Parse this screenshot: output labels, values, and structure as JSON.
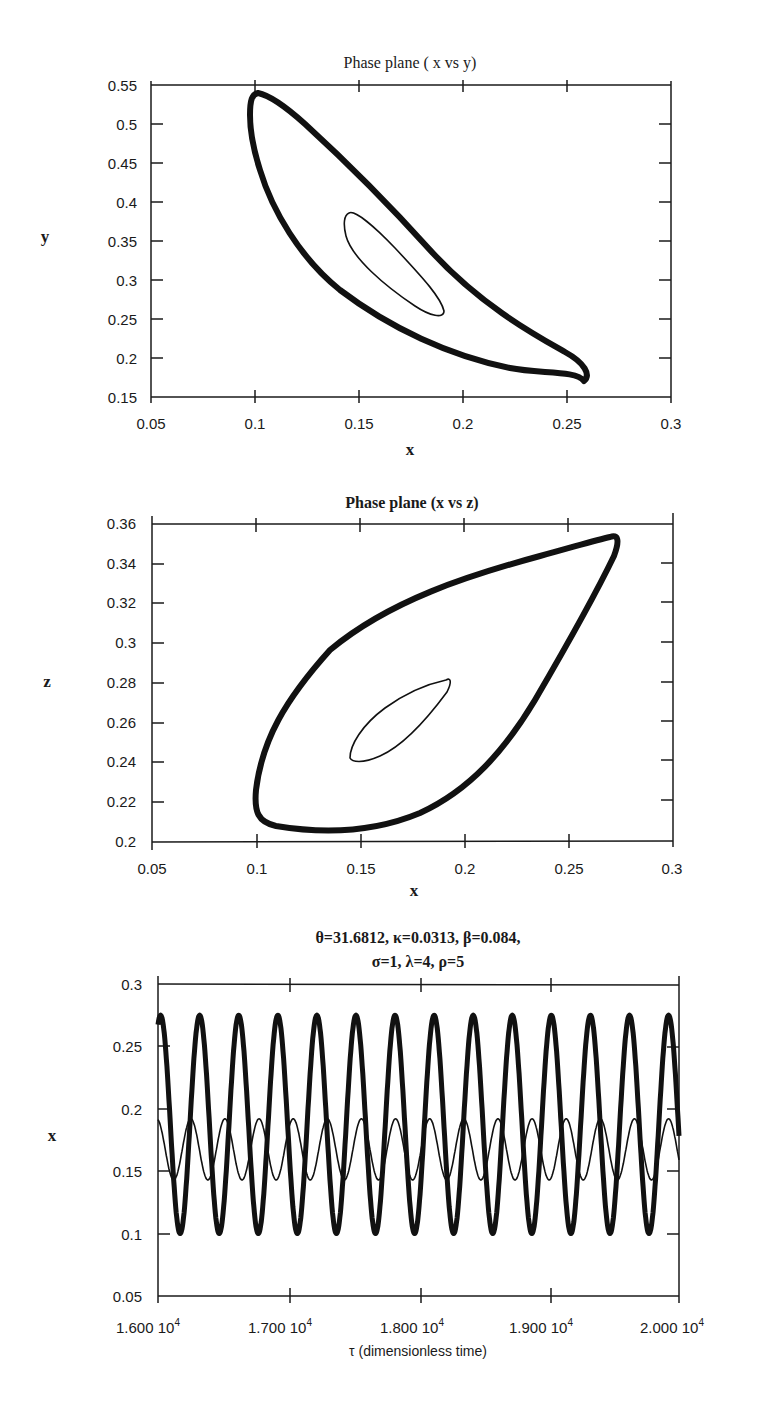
{
  "chart_data": [
    {
      "type": "line",
      "title": "Phase plane ( x vs y)",
      "xlabel": "x",
      "ylabel": "y",
      "xlim": [
        0.05,
        0.3
      ],
      "ylim": [
        0.15,
        0.55
      ],
      "xticks": [
        "0.05",
        "0.1",
        "0.15",
        "0.2",
        "0.25",
        "0.3"
      ],
      "yticks": [
        "0.15",
        "0.2",
        "0.25",
        "0.3",
        "0.35",
        "0.4",
        "0.45",
        "0.5",
        "0.55"
      ],
      "grid": false,
      "series": [
        {
          "name": "outer limit cycle (thick)",
          "description": "closed orbit",
          "x_range": [
            0.1,
            0.275
          ],
          "y_range": [
            0.183,
            0.545
          ]
        },
        {
          "name": "inner orbit (thin)",
          "description": "closed orbit",
          "x_range": [
            0.145,
            0.192
          ],
          "y_range": [
            0.283,
            0.385
          ]
        }
      ]
    },
    {
      "type": "line",
      "title": "Phase plane (x vs z)",
      "xlabel": "x",
      "ylabel": "z",
      "xlim": [
        0.05,
        0.3
      ],
      "ylim": [
        0.2,
        0.36
      ],
      "xticks": [
        "0.05",
        "0.1",
        "0.15",
        "0.2",
        "0.25",
        "0.3"
      ],
      "yticks": [
        "0.2",
        "0.22",
        "0.24",
        "0.26",
        "0.28",
        "0.3",
        "0.32",
        "0.34",
        "0.36"
      ],
      "grid": false,
      "series": [
        {
          "name": "outer limit cycle (thick)",
          "description": "closed orbit",
          "x_range": [
            0.1,
            0.274
          ],
          "y_range": [
            0.209,
            0.355
          ]
        },
        {
          "name": "inner orbit (thin)",
          "description": "closed orbit",
          "x_range": [
            0.144,
            0.191
          ],
          "y_range": [
            0.243,
            0.282
          ]
        }
      ]
    },
    {
      "type": "line",
      "title": "θ=31.6812, κ=0.0313, β=0.084, σ=1, λ=4, ρ=5",
      "title_lines": [
        "θ=31.6812, κ=0.0313, β=0.084,",
        "σ=1, λ=4, ρ=5"
      ],
      "xlabel": "τ (dimensionless time)",
      "ylabel": "x",
      "xlim": [
        16000,
        20000
      ],
      "ylim": [
        0.05,
        0.3
      ],
      "xticks": [
        "1.600 10^4",
        "1.700 10^4",
        "1.800 10^4",
        "1.900 10^4",
        "2.000 10^4"
      ],
      "yticks": [
        "0.05",
        "0.1",
        "0.15",
        "0.2",
        "0.25",
        "0.3"
      ],
      "grid": false,
      "series": [
        {
          "name": "thick oscillation",
          "min": 0.1,
          "max": 0.275,
          "period": 300,
          "cycles_visible": 13
        },
        {
          "name": "thin oscillation",
          "min": 0.143,
          "max": 0.192,
          "period": 262,
          "cycles_visible": 15
        }
      ]
    }
  ],
  "plot1": {
    "title": "Phase plane ( x vs y)",
    "xlabel": "x",
    "ylabel": "y",
    "xticks": [
      "0.05",
      "0.1",
      "0.15",
      "0.2",
      "0.25",
      "0.3"
    ],
    "yticks": [
      "0.15",
      "0.2",
      "0.25",
      "0.3",
      "0.35",
      "0.4",
      "0.45",
      "0.5",
      "0.55"
    ]
  },
  "plot2": {
    "title": "Phase plane (x vs z)",
    "xlabel": "x",
    "ylabel": "z",
    "xticks": [
      "0.05",
      "0.1",
      "0.15",
      "0.2",
      "0.25",
      "0.3"
    ],
    "yticks": [
      "0.2",
      "0.22",
      "0.24",
      "0.26",
      "0.28",
      "0.3",
      "0.32",
      "0.34",
      "0.36"
    ]
  },
  "plot3": {
    "title_line1": "θ=31.6812, κ=0.0313, β=0.084,",
    "title_line2": "σ=1, λ=4, ρ=5",
    "xlabel": "τ (dimensionless time)",
    "ylabel": "x",
    "xticks": [
      "1.600",
      "1.700",
      "1.800",
      "1.900",
      "2.000"
    ],
    "xtick_exponent": "10",
    "xtick_power": "4",
    "yticks": [
      "0.05",
      "0.1",
      "0.15",
      "0.2",
      "0.25",
      "0.3"
    ]
  }
}
